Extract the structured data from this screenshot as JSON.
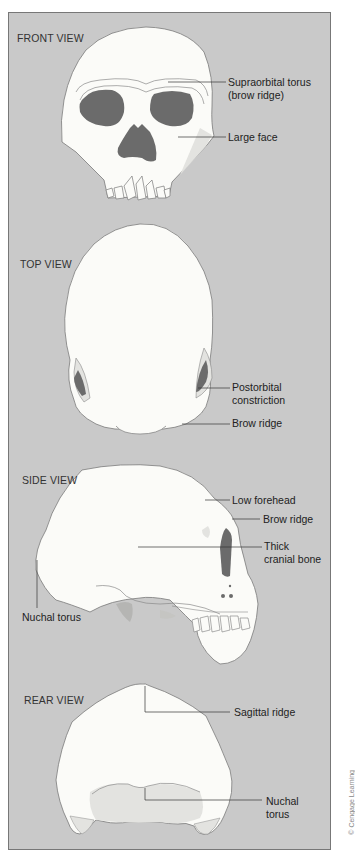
{
  "figure": {
    "colors": {
      "background": "#c9c9c9",
      "bone": "#fbfbf8",
      "shadow": "#e3e3e0",
      "cavity": "#6b6b6b",
      "outline": "#7a7a7a",
      "leader": "#333333"
    },
    "views": [
      {
        "title": "FRONT VIEW",
        "labels": [
          "Supraorbital torus",
          "(brow ridge)",
          "Large face"
        ]
      },
      {
        "title": "TOP VIEW",
        "labels": [
          "Postorbital",
          "constriction",
          "Brow ridge"
        ]
      },
      {
        "title": "SIDE VIEW",
        "labels": [
          "Low forehead",
          "Brow ridge",
          "Thick",
          "cranial bone",
          "Nuchal torus"
        ]
      },
      {
        "title": "REAR VIEW",
        "labels": [
          "Sagittal ridge",
          "Nuchal",
          "torus"
        ]
      }
    ],
    "credit": "© Cengage Learning"
  }
}
